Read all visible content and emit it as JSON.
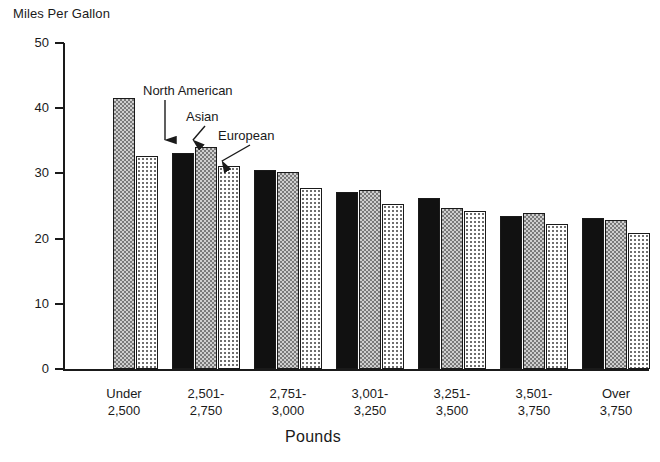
{
  "chart_data": {
    "type": "bar",
    "title": "",
    "ylabel": "Miles Per Gallon",
    "xlabel": "Pounds",
    "ylim": [
      0,
      50
    ],
    "yticks": [
      0,
      10,
      20,
      30,
      40,
      50
    ],
    "grid": false,
    "legend_position": "annotated-arrows",
    "categories": [
      "Under\n2,500",
      "2,501-\n2,750",
      "2,751-\n3,000",
      "3,001-\n3,250",
      "3,251-\n3,500",
      "3,501-\n3,750",
      "Over\n3,750"
    ],
    "category_lines": [
      [
        "Under",
        "2,500"
      ],
      [
        "2,501-",
        "2,750"
      ],
      [
        "2,751-",
        "3,000"
      ],
      [
        "3,001-",
        "3,250"
      ],
      [
        "3,251-",
        "3,500"
      ],
      [
        "3,501-",
        "3,750"
      ],
      [
        "Over",
        "3,750"
      ]
    ],
    "series": [
      {
        "name": "North American",
        "values": [
          null,
          33.2,
          30.5,
          27.1,
          26.3,
          23.5,
          23.2
        ]
      },
      {
        "name": "Asian",
        "values": [
          41.5,
          34.0,
          30.2,
          27.4,
          24.7,
          24.0,
          22.9
        ]
      },
      {
        "name": "European",
        "values": [
          32.7,
          31.2,
          27.8,
          25.3,
          24.2,
          22.2,
          20.8
        ]
      }
    ],
    "annotations": [
      {
        "label": "North American",
        "target_series": "North American",
        "target_category": "2,501-2,750"
      },
      {
        "label": "Asian",
        "target_series": "Asian",
        "target_category": "2,501-2,750"
      },
      {
        "label": "European",
        "target_series": "European",
        "target_category": "2,501-2,750"
      }
    ]
  },
  "axis": {
    "y_title": "Miles Per Gallon",
    "x_title": "Pounds",
    "y_tick_labels": [
      "50",
      "40",
      "30",
      "20",
      "10",
      "0"
    ]
  },
  "annotations": {
    "north_american": "North American",
    "asian": "Asian",
    "european": "European"
  },
  "colors": {
    "ink": "#1a1a1a",
    "north_american_fill": "#111111",
    "asian_fill": "#cfcfcf",
    "european_fill": "#ffffff",
    "background": "#ffffff"
  }
}
